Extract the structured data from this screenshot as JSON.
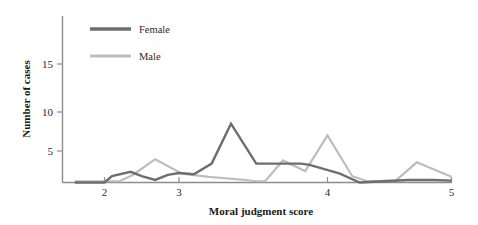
{
  "chart_data": {
    "type": "line",
    "title": "",
    "subtitle": "",
    "xlabel": "Moral judgment score",
    "ylabel": "Number of cases",
    "xlim": [
      1.72,
      5.0
    ],
    "ylim": [
      0,
      19.5
    ],
    "xticks": [
      2,
      3,
      4,
      5
    ],
    "xtick_labels": [
      "2",
      "3",
      "4",
      "5"
    ],
    "yticks": [
      5,
      10,
      15
    ],
    "ytick_labels": [
      "5",
      "10",
      "15"
    ],
    "grid": false,
    "legend_position": "top-left-inside",
    "series": [
      {
        "name": "Female",
        "color": "#6e6e6e",
        "points": [
          [
            1.8,
            0.0
          ],
          [
            2.0,
            0.0
          ],
          [
            2.1,
            1.0
          ],
          [
            2.35,
            1.7
          ],
          [
            2.5,
            1.0
          ],
          [
            2.68,
            0.4
          ],
          [
            2.85,
            1.2
          ],
          [
            3.0,
            1.5
          ],
          [
            3.1,
            1.3
          ],
          [
            3.22,
            3.0
          ],
          [
            3.35,
            8.5
          ],
          [
            3.52,
            3.0
          ],
          [
            3.7,
            3.0
          ],
          [
            3.82,
            3.0
          ],
          [
            3.88,
            2.8
          ],
          [
            4.1,
            1.4
          ],
          [
            4.26,
            0.0
          ],
          [
            4.45,
            0.2
          ],
          [
            4.65,
            0.4
          ],
          [
            4.85,
            0.4
          ],
          [
            5.0,
            0.3
          ]
        ]
      },
      {
        "name": "Male",
        "color": "#bdbdbd",
        "points": [
          [
            1.8,
            0.2
          ],
          [
            2.2,
            0.2
          ],
          [
            2.38,
            1.2
          ],
          [
            2.68,
            3.7
          ],
          [
            3.02,
            1.4
          ],
          [
            3.2,
            0.9
          ],
          [
            3.45,
            0.4
          ],
          [
            3.52,
            0.2
          ],
          [
            3.58,
            0.2
          ],
          [
            3.7,
            3.5
          ],
          [
            3.85,
            1.8
          ],
          [
            4.0,
            7.0
          ],
          [
            4.2,
            1.0
          ],
          [
            4.32,
            0.2
          ],
          [
            4.55,
            0.3
          ],
          [
            4.72,
            3.2
          ],
          [
            5.0,
            0.9
          ]
        ]
      }
    ],
    "legend": [
      {
        "label": "Female",
        "color": "#6e6e6e"
      },
      {
        "label": "Male",
        "color": "#bdbdbd"
      }
    ]
  },
  "axes": {
    "y_axis_title": "Number of cases",
    "x_axis_title": "Moral judgment score",
    "y_tick_5": "5",
    "y_tick_10": "10",
    "y_tick_15": "15",
    "x_tick_2": "2",
    "x_tick_3": "3",
    "x_tick_4": "4",
    "x_tick_5": "5"
  },
  "legend": {
    "female_label": "Female",
    "male_label": "Male"
  },
  "colors": {
    "female": "#6e6e6e",
    "male": "#bdbdbd",
    "axis": "#8d8d8d",
    "text": "#2b2b2b",
    "background": "#ffffff"
  }
}
